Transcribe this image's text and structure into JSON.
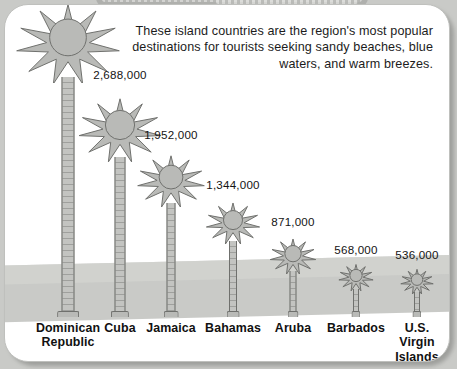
{
  "panel": {
    "caption": "These island countries are the region's most popular destinations for tourists seeking sandy beaches, blue waters, and warm breezes."
  },
  "colors": {
    "page_background": "#c9cac7",
    "panel_background": "#ffffff",
    "panel_border": "#bfc0bd",
    "tree_fill": "#b9bab7",
    "tree_outline": "#6f706d",
    "band": "#c6c7c4",
    "text": "#111111"
  },
  "chart_data": {
    "type": "bar",
    "title": "",
    "subtitle": "These island countries are the region's most popular destinations for tourists seeking sandy beaches, blue waters, and warm breezes.",
    "xlabel": "",
    "ylabel": "",
    "unit": "tourist arrivals",
    "glyph": "palm-tree",
    "grid": false,
    "legend": false,
    "ylim": [
      0,
      4306000
    ],
    "categories": [
      "Dominican Republic",
      "Cuba",
      "Jamaica",
      "Bahamas",
      "Aruba",
      "Barbados",
      "U.S. Virgin Islands"
    ],
    "values": [
      4306000,
      2688000,
      1952000,
      1344000,
      871000,
      568000,
      536000
    ],
    "value_labels": [
      "4,306,000*",
      "2,688,000",
      "1,952,000",
      "1,344,000",
      "871,000",
      "568,000",
      "536,000"
    ],
    "annotations": [
      "* asterisk on Dominican Republic value"
    ]
  },
  "trees": [
    {
      "label_lines": [
        "Dominican",
        "Republic"
      ],
      "value": "4,306,000*",
      "cx": 63,
      "crown": 108,
      "trunk_top": 72,
      "label_top": 316
    },
    {
      "label_lines": [
        "Cuba"
      ],
      "value": "2,688,000",
      "cx": 115,
      "crown": 86,
      "trunk_top": 152,
      "label_top": 316
    },
    {
      "label_lines": [
        "Jamaica"
      ],
      "value": "1,952,000",
      "cx": 166,
      "crown": 70,
      "trunk_top": 198,
      "label_top": 316
    },
    {
      "label_lines": [
        "Bahamas"
      ],
      "value": "1,344,000",
      "cx": 228,
      "crown": 56,
      "trunk_top": 236,
      "label_top": 316
    },
    {
      "label_lines": [
        "Aruba"
      ],
      "value": "871,000",
      "cx": 288,
      "crown": 48,
      "trunk_top": 266,
      "label_top": 316
    },
    {
      "label_lines": [
        "Barbados"
      ],
      "value": "568,000",
      "cx": 351,
      "crown": 36,
      "trunk_top": 284,
      "label_top": 316
    },
    {
      "label_lines": [
        "U.S.",
        "Virgin",
        "Islands"
      ],
      "value": "536,000",
      "cx": 412,
      "crown": 34,
      "trunk_top": 287,
      "label_top": 316
    }
  ]
}
